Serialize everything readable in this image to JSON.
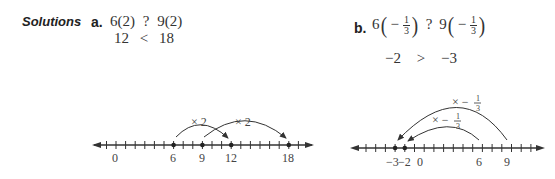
{
  "heading": "Solutions",
  "part_a": {
    "label": "a.",
    "line1": {
      "left": "6(2)",
      "op": "?",
      "right": "9(2)"
    },
    "line2": {
      "left": "12",
      "op": "<",
      "right": "18"
    }
  },
  "part_b": {
    "label": "b.",
    "line1": {
      "left_coef": "6",
      "left_sign": "−",
      "left_num": "1",
      "left_den": "3",
      "op": "?",
      "right_coef": "9",
      "right_sign": "−",
      "right_num": "1",
      "right_den": "3"
    },
    "line2": {
      "left": "−2",
      "op": ">",
      "right": "−3"
    }
  },
  "number_line_a": {
    "labels": [
      {
        "value": 0,
        "text": "0"
      },
      {
        "value": 6,
        "text": "6"
      },
      {
        "value": 9,
        "text": "9"
      },
      {
        "value": 12,
        "text": "12"
      },
      {
        "value": 18,
        "text": "18"
      }
    ],
    "points": [
      6,
      9,
      12,
      18
    ],
    "arrows": [
      {
        "from": 6,
        "to": 12,
        "label": "× 2"
      },
      {
        "from": 9,
        "to": 18,
        "label": "× 2"
      }
    ]
  },
  "number_line_b": {
    "labels": [
      {
        "value": -3,
        "text": "−3"
      },
      {
        "value": -2,
        "text": "−2"
      },
      {
        "value": 0,
        "text": "0"
      },
      {
        "value": 6,
        "text": "6"
      },
      {
        "value": 9,
        "text": "9"
      }
    ],
    "points": [
      -3,
      -2
    ],
    "arrows": [
      {
        "from": 6,
        "to": -2,
        "label": "× −",
        "frac_num": "1",
        "frac_den": "3"
      },
      {
        "from": 9,
        "to": -3,
        "label": "× −",
        "frac_num": "1",
        "frac_den": "3"
      }
    ]
  }
}
